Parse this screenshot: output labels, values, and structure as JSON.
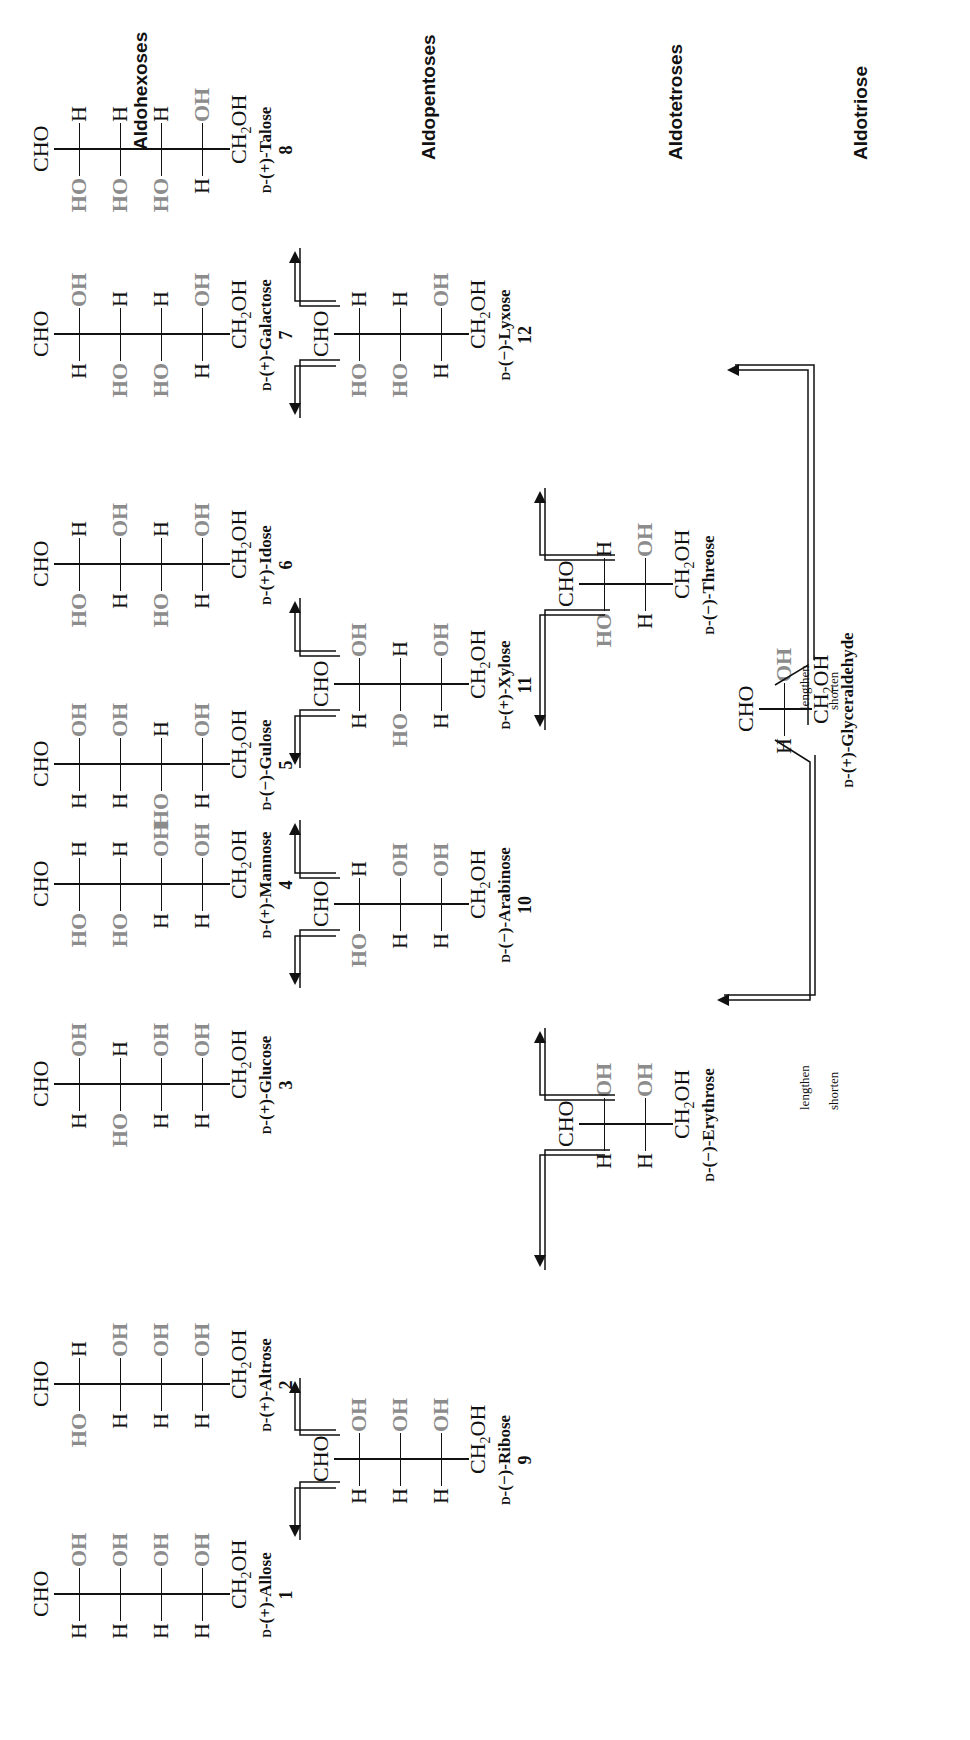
{
  "categories": {
    "hexoses": "Aldohexoses",
    "pentoses": "Aldopentoses",
    "tetroses": "Aldotetroses",
    "triose": "Aldotriose"
  },
  "pathway_labels": {
    "lengthen": "lengthen",
    "shorten": "shorten"
  },
  "common": {
    "top_group": "CHO",
    "bottom_group_main": "CH",
    "bottom_group_sub": "2",
    "bottom_group_tail": "OH",
    "d_prefix": "D"
  },
  "sugars": [
    {
      "id": "allose",
      "number": "1",
      "rotation": "(+)",
      "name": "Allose",
      "left": [
        "H",
        "H",
        "H",
        "H"
      ],
      "right": [
        "OH",
        "OH",
        "OH",
        "OH"
      ]
    },
    {
      "id": "altrose",
      "number": "2",
      "rotation": "(+)",
      "name": "Altrose",
      "left": [
        "HO",
        "H",
        "H",
        "H"
      ],
      "right": [
        "H",
        "OH",
        "OH",
        "OH"
      ]
    },
    {
      "id": "glucose",
      "number": "3",
      "rotation": "(+)",
      "name": "Glucose",
      "left": [
        "H",
        "HO",
        "H",
        "H"
      ],
      "right": [
        "OH",
        "H",
        "OH",
        "OH"
      ]
    },
    {
      "id": "mannose",
      "number": "4",
      "rotation": "(+)",
      "name": "Mannose",
      "left": [
        "HO",
        "HO",
        "H",
        "H"
      ],
      "right": [
        "H",
        "H",
        "OH",
        "OH"
      ]
    },
    {
      "id": "gulose",
      "number": "5",
      "rotation": "(−)",
      "name": "Gulose",
      "left": [
        "H",
        "H",
        "HO",
        "H"
      ],
      "right": [
        "OH",
        "OH",
        "H",
        "OH"
      ]
    },
    {
      "id": "idose",
      "number": "6",
      "rotation": "(+)",
      "name": "Idose",
      "left": [
        "HO",
        "H",
        "HO",
        "H"
      ],
      "right": [
        "H",
        "OH",
        "H",
        "OH"
      ]
    },
    {
      "id": "galactose",
      "number": "7",
      "rotation": "(+)",
      "name": "Galactose",
      "left": [
        "H",
        "HO",
        "HO",
        "H"
      ],
      "right": [
        "OH",
        "H",
        "H",
        "OH"
      ]
    },
    {
      "id": "talose",
      "number": "8",
      "rotation": "(+)",
      "name": "Talose",
      "left": [
        "HO",
        "HO",
        "HO",
        "H"
      ],
      "right": [
        "H",
        "H",
        "H",
        "OH"
      ]
    },
    {
      "id": "ribose",
      "number": "9",
      "rotation": "(−)",
      "name": "Ribose",
      "left": [
        "H",
        "H",
        "H"
      ],
      "right": [
        "OH",
        "OH",
        "OH"
      ]
    },
    {
      "id": "arabinose",
      "number": "10",
      "rotation": "(−)",
      "name": "Arabinose",
      "left": [
        "HO",
        "H",
        "H"
      ],
      "right": [
        "H",
        "OH",
        "OH"
      ]
    },
    {
      "id": "xylose",
      "number": "11",
      "rotation": "(+)",
      "name": "Xylose",
      "left": [
        "H",
        "HO",
        "H"
      ],
      "right": [
        "OH",
        "H",
        "OH"
      ]
    },
    {
      "id": "lyxose",
      "number": "12",
      "rotation": "(−)",
      "name": "Lyxose",
      "left": [
        "HO",
        "HO",
        "H"
      ],
      "right": [
        "H",
        "H",
        "OH"
      ]
    },
    {
      "id": "erythrose",
      "number": "",
      "rotation": "(−)",
      "name": "Erythrose",
      "left": [
        "H",
        "H"
      ],
      "right": [
        "OH",
        "OH"
      ]
    },
    {
      "id": "threose",
      "number": "",
      "rotation": "(−)",
      "name": "Threose",
      "left": [
        "HO",
        "H"
      ],
      "right": [
        "H",
        "OH"
      ]
    },
    {
      "id": "glyceraldehyde",
      "number": "",
      "rotation": "(+)",
      "name": "Glyceraldehyde",
      "left": [
        "H"
      ],
      "right": [
        "OH"
      ]
    }
  ],
  "colors": {
    "hydroxyl": "#8c8c8c",
    "ink": "#111111",
    "background": "#ffffff"
  }
}
